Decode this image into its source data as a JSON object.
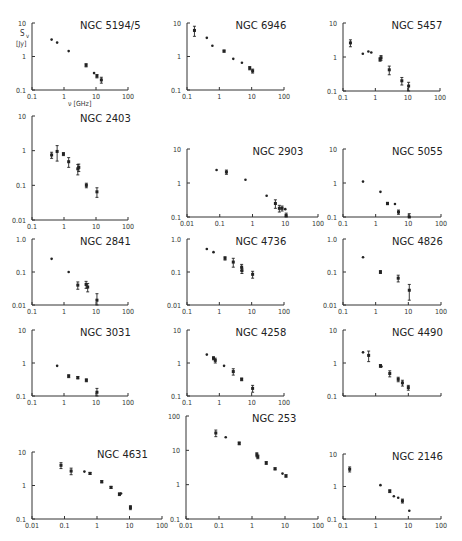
{
  "figure": {
    "ylabel_symbol": "S",
    "ylabel_sub": "v",
    "ylabel_unit": "[Jy]",
    "xlabel": "ν [GHz]"
  },
  "chart_data": [
    {
      "type": "scatter",
      "title": "NGC 5194/5",
      "xlim": [
        0.1,
        100
      ],
      "ylim": [
        0.1,
        10
      ],
      "xticks": [
        "0.1",
        "1",
        "10",
        "100"
      ],
      "yticks": [
        "0.1",
        "1",
        "10"
      ],
      "xlabel": "ν [GHz]",
      "ylabel": "S_ν [Jy]",
      "points": [
        {
          "x": 0.41,
          "y": 3.2
        },
        {
          "x": 0.61,
          "y": 2.6
        },
        {
          "x": 1.4,
          "y": 1.45
        },
        {
          "x": 4.9,
          "y": 0.55,
          "err": 0.06
        },
        {
          "x": 8.7,
          "y": 0.32
        },
        {
          "x": 10.7,
          "y": 0.26,
          "err": 0.03
        },
        {
          "x": 14.7,
          "y": 0.2,
          "err": 0.04
        }
      ]
    },
    {
      "type": "scatter",
      "title": "NGC 6946",
      "xlim": [
        0.1,
        100
      ],
      "ylim": [
        0.1,
        10
      ],
      "xticks": [
        "0.1",
        "1",
        "10",
        "100"
      ],
      "yticks": [
        "0.1",
        "1",
        "10"
      ],
      "points": [
        {
          "x": 0.17,
          "y": 6.0,
          "err": 2.0
        },
        {
          "x": 0.41,
          "y": 3.6
        },
        {
          "x": 0.61,
          "y": 2.1
        },
        {
          "x": 1.4,
          "y": 1.45,
          "err": 0.1
        },
        {
          "x": 2.7,
          "y": 0.85
        },
        {
          "x": 5.0,
          "y": 0.65
        },
        {
          "x": 8.7,
          "y": 0.45,
          "err": 0.05
        },
        {
          "x": 10.7,
          "y": 0.37,
          "err": 0.05
        }
      ]
    },
    {
      "type": "scatter",
      "title": "NGC 5457",
      "xlim": [
        0.1,
        100
      ],
      "ylim": [
        0.1,
        10
      ],
      "xticks": [
        "0.1",
        "1",
        "10",
        "100"
      ],
      "yticks": [
        "0.1",
        "1",
        "10"
      ],
      "points": [
        {
          "x": 0.17,
          "y": 2.6,
          "err": 0.6
        },
        {
          "x": 0.41,
          "y": 1.25
        },
        {
          "x": 0.61,
          "y": 1.45
        },
        {
          "x": 0.75,
          "y": 1.35
        },
        {
          "x": 1.4,
          "y": 0.85,
          "err": 0.1
        },
        {
          "x": 1.5,
          "y": 0.95,
          "err": 0.15
        },
        {
          "x": 2.7,
          "y": 0.42,
          "err": 0.12
        },
        {
          "x": 6.6,
          "y": 0.2,
          "err": 0.05
        },
        {
          "x": 10.7,
          "y": 0.14,
          "err": 0.04
        }
      ]
    },
    {
      "type": "scatter",
      "title": "NGC 2403",
      "xlim": [
        0.1,
        100
      ],
      "ylim": [
        0.01,
        10
      ],
      "xticks": [
        "0.1",
        "1",
        "10",
        "100"
      ],
      "yticks": [
        "0.01",
        "0.1",
        "1",
        "10"
      ],
      "points": [
        {
          "x": 0.41,
          "y": 0.75,
          "err": 0.15
        },
        {
          "x": 0.61,
          "y": 0.95,
          "err": 0.45
        },
        {
          "x": 0.96,
          "y": 0.8,
          "err": 0.08
        },
        {
          "x": 1.4,
          "y": 0.48,
          "err": 0.15
        },
        {
          "x": 2.7,
          "y": 0.3,
          "err": 0.1
        },
        {
          "x": 2.9,
          "y": 0.33,
          "err": 0.08
        },
        {
          "x": 5.0,
          "y": 0.1,
          "err": 0.015
        },
        {
          "x": 10.7,
          "y": 0.065,
          "err": 0.02
        }
      ]
    },
    {
      "type": "scatter",
      "title": "NGC 2903",
      "xlim": [
        0.01,
        100
      ],
      "ylim": [
        0.1,
        10
      ],
      "xticks": [
        "0.01",
        "0.1",
        "1",
        "10",
        "100"
      ],
      "yticks": [
        "0.1",
        "1",
        "10"
      ],
      "points": [
        {
          "x": 0.08,
          "y": 2.4
        },
        {
          "x": 0.16,
          "y": 2.1,
          "err": 0.3
        },
        {
          "x": 0.61,
          "y": 1.25
        },
        {
          "x": 2.7,
          "y": 0.42
        },
        {
          "x": 5.0,
          "y": 0.25,
          "err": 0.07
        },
        {
          "x": 6.6,
          "y": 0.18,
          "err": 0.04
        },
        {
          "x": 8.0,
          "y": 0.18,
          "err": 0.03
        },
        {
          "x": 10.0,
          "y": 0.17
        },
        {
          "x": 10.7,
          "y": 0.11,
          "err": 0.02
        }
      ]
    },
    {
      "type": "scatter",
      "title": "NGC 5055",
      "xlim": [
        0.1,
        100
      ],
      "ylim": [
        0.1,
        10
      ],
      "xticks": [
        "0.1",
        "1",
        "10",
        "100"
      ],
      "yticks": [
        "0.1",
        "1",
        "10"
      ],
      "points": [
        {
          "x": 0.41,
          "y": 1.1
        },
        {
          "x": 1.4,
          "y": 0.55
        },
        {
          "x": 2.3,
          "y": 0.25,
          "err": 0.02
        },
        {
          "x": 3.9,
          "y": 0.24
        },
        {
          "x": 5.0,
          "y": 0.14,
          "err": 0.02
        },
        {
          "x": 10.7,
          "y": 0.1,
          "err": 0.025
        }
      ]
    },
    {
      "type": "scatter",
      "title": "NGC 2841",
      "xlim": [
        0.1,
        100
      ],
      "ylim": [
        0.01,
        1.0
      ],
      "xticks": [
        "0.1",
        "1",
        "10",
        "100"
      ],
      "yticks": [
        "0.01",
        "0.1",
        "1.0"
      ],
      "points": [
        {
          "x": 0.41,
          "y": 0.25
        },
        {
          "x": 1.4,
          "y": 0.1
        },
        {
          "x": 2.7,
          "y": 0.04,
          "err": 0.01
        },
        {
          "x": 4.9,
          "y": 0.042,
          "err": 0.01
        },
        {
          "x": 5.5,
          "y": 0.035,
          "err": 0.01
        },
        {
          "x": 10.7,
          "y": 0.014,
          "err": 0.008
        }
      ]
    },
    {
      "type": "scatter",
      "title": "NGC 4736",
      "xlim": [
        0.1,
        100
      ],
      "ylim": [
        0.01,
        1.0
      ],
      "xticks": [
        "0.1",
        "1",
        "10",
        "100"
      ],
      "yticks": [
        "0.01",
        "0.1",
        "1.0"
      ],
      "points": [
        {
          "x": 0.41,
          "y": 0.5
        },
        {
          "x": 0.66,
          "y": 0.4
        },
        {
          "x": 1.5,
          "y": 0.26,
          "err": 0.03
        },
        {
          "x": 2.7,
          "y": 0.2,
          "err": 0.06
        },
        {
          "x": 4.9,
          "y": 0.14,
          "err": 0.03
        },
        {
          "x": 5.0,
          "y": 0.11,
          "err": 0.02
        },
        {
          "x": 10.7,
          "y": 0.085,
          "err": 0.02
        }
      ]
    },
    {
      "type": "scatter",
      "title": "NGC 4826",
      "xlim": [
        0.1,
        100
      ],
      "ylim": [
        0.01,
        1.0
      ],
      "xticks": [
        "0.1",
        "1",
        "10",
        "100"
      ],
      "yticks": [
        "0.01",
        "0.1",
        "1.0"
      ],
      "points": [
        {
          "x": 0.41,
          "y": 0.28
        },
        {
          "x": 1.4,
          "y": 0.1,
          "err": 0.01
        },
        {
          "x": 4.9,
          "y": 0.065,
          "err": 0.015
        },
        {
          "x": 10.7,
          "y": 0.028,
          "err": 0.014
        }
      ]
    },
    {
      "type": "scatter",
      "title": "NGC 3031",
      "xlim": [
        0.1,
        100
      ],
      "ylim": [
        0.1,
        10
      ],
      "xticks": [
        "0.1",
        "1",
        "10",
        "100"
      ],
      "yticks": [
        "0.1",
        "1",
        "10"
      ],
      "points": [
        {
          "x": 0.61,
          "y": 0.82
        },
        {
          "x": 1.4,
          "y": 0.4,
          "err": 0.04
        },
        {
          "x": 2.7,
          "y": 0.36,
          "err": 0.03
        },
        {
          "x": 5.0,
          "y": 0.3,
          "err": 0.03
        },
        {
          "x": 10.7,
          "y": 0.13,
          "err": 0.04
        }
      ]
    },
    {
      "type": "scatter",
      "title": "NGC 4258",
      "xlim": [
        0.1,
        100
      ],
      "ylim": [
        0.1,
        10
      ],
      "xticks": [
        "0.1",
        "1",
        "10",
        "100"
      ],
      "yticks": [
        "0.1",
        "1",
        "10"
      ],
      "points": [
        {
          "x": 0.41,
          "y": 1.8
        },
        {
          "x": 0.66,
          "y": 1.4,
          "err": 0.15
        },
        {
          "x": 0.75,
          "y": 1.2,
          "err": 0.2
        },
        {
          "x": 1.4,
          "y": 0.82
        },
        {
          "x": 2.7,
          "y": 0.55,
          "err": 0.12
        },
        {
          "x": 4.9,
          "y": 0.32,
          "err": 0.03
        },
        {
          "x": 10.7,
          "y": 0.17,
          "err": 0.04
        }
      ]
    },
    {
      "type": "scatter",
      "title": "NGC 4490",
      "xlim": [
        0.1,
        100
      ],
      "ylim": [
        0.1,
        10
      ],
      "xticks": [
        "0.1",
        "1",
        "10",
        "100"
      ],
      "yticks": [
        "0.1",
        "1",
        "10"
      ],
      "points": [
        {
          "x": 0.41,
          "y": 2.1
        },
        {
          "x": 0.61,
          "y": 1.7,
          "err": 0.6
        },
        {
          "x": 1.4,
          "y": 0.82,
          "err": 0.08
        },
        {
          "x": 1.5,
          "y": 0.78
        },
        {
          "x": 2.7,
          "y": 0.48,
          "err": 0.1
        },
        {
          "x": 4.9,
          "y": 0.32,
          "err": 0.05
        },
        {
          "x": 6.6,
          "y": 0.25,
          "err": 0.05
        },
        {
          "x": 10.0,
          "y": 0.18,
          "err": 0.03
        }
      ]
    },
    {
      "type": "scatter",
      "title": "NGC 4631",
      "xlim": [
        0.01,
        100
      ],
      "ylim": [
        0.1,
        10
      ],
      "xticks": [
        "0.01",
        "0.1",
        "1",
        "10",
        "100"
      ],
      "yticks": [
        "0.1",
        "1",
        "10"
      ],
      "points": [
        {
          "x": 0.078,
          "y": 4.0,
          "err": 0.8
        },
        {
          "x": 0.16,
          "y": 2.7,
          "err": 0.6
        },
        {
          "x": 0.41,
          "y": 2.6
        },
        {
          "x": 0.61,
          "y": 2.3,
          "err": 0.15
        },
        {
          "x": 1.4,
          "y": 1.3,
          "err": 0.1
        },
        {
          "x": 2.7,
          "y": 0.88,
          "err": 0.06
        },
        {
          "x": 4.9,
          "y": 0.55,
          "err": 0.05
        },
        {
          "x": 5.5,
          "y": 0.58
        },
        {
          "x": 10.7,
          "y": 0.22,
          "err": 0.03
        }
      ]
    },
    {
      "type": "scatter",
      "title": "NGC 253",
      "xlim": [
        0.01,
        100
      ],
      "ylim": [
        0.1,
        100
      ],
      "xticks": [
        "0.01",
        "0.1",
        "1",
        "10",
        "100"
      ],
      "yticks": [
        "0.1",
        "1",
        "10",
        "100"
      ],
      "points": [
        {
          "x": 0.08,
          "y": 32,
          "err": 7
        },
        {
          "x": 0.16,
          "y": 24
        },
        {
          "x": 0.41,
          "y": 16,
          "err": 1.5
        },
        {
          "x": 1.4,
          "y": 7.5,
          "err": 1
        },
        {
          "x": 1.5,
          "y": 6.5,
          "err": 0.8
        },
        {
          "x": 2.7,
          "y": 4.3,
          "err": 0.4
        },
        {
          "x": 5.0,
          "y": 2.9,
          "err": 0.2
        },
        {
          "x": 8.4,
          "y": 2.1
        },
        {
          "x": 10.7,
          "y": 1.8,
          "err": 0.15
        }
      ]
    },
    {
      "type": "scatter",
      "title": "NGC 2146",
      "xlim": [
        0.1,
        100
      ],
      "ylim": [
        0.1,
        10
      ],
      "xticks": [
        "0.1",
        "1",
        "10",
        "100"
      ],
      "yticks": [
        "0.1",
        "1",
        "10"
      ],
      "points": [
        {
          "x": 0.16,
          "y": 3.4,
          "err": 0.6
        },
        {
          "x": 1.4,
          "y": 1.1
        },
        {
          "x": 2.7,
          "y": 0.72,
          "err": 0.07
        },
        {
          "x": 3.6,
          "y": 0.5
        },
        {
          "x": 4.9,
          "y": 0.45
        },
        {
          "x": 6.6,
          "y": 0.36,
          "err": 0.05
        },
        {
          "x": 10.7,
          "y": 0.18
        }
      ]
    }
  ]
}
